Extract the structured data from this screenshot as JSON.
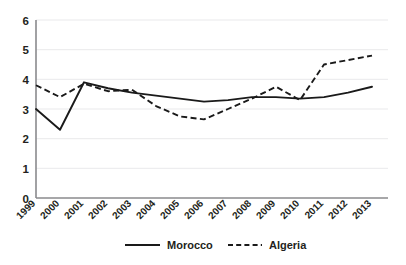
{
  "chart_data": {
    "type": "line",
    "title": "",
    "subtitle": "",
    "xlabel": "",
    "ylabel": "",
    "x": [
      "1999",
      "2000",
      "2001",
      "2002",
      "2003",
      "2004",
      "2005",
      "2006",
      "2007",
      "2008",
      "2009",
      "2010",
      "2011",
      "2012",
      "2013"
    ],
    "categories": [
      "1999",
      "2000",
      "2001",
      "2002",
      "2003",
      "2004",
      "2005",
      "2006",
      "2007",
      "2008",
      "2009",
      "2010",
      "2011",
      "2012",
      "2013"
    ],
    "series": [
      {
        "name": "Morocco",
        "style": "solid",
        "color": "#1a1a1a",
        "values": [
          3.0,
          2.3,
          3.9,
          3.7,
          3.55,
          3.45,
          3.35,
          3.25,
          3.3,
          3.4,
          3.4,
          3.35,
          3.4,
          3.55,
          3.75
        ]
      },
      {
        "name": "Algeria",
        "style": "dashed",
        "color": "#1a1a1a",
        "values": [
          3.8,
          3.4,
          3.85,
          3.6,
          3.65,
          3.1,
          2.75,
          2.65,
          3.0,
          3.35,
          3.75,
          3.3,
          4.5,
          4.65,
          4.8
        ]
      }
    ],
    "ylim": [
      0,
      6
    ],
    "yticks": [
      "0",
      "1",
      "2",
      "3",
      "4",
      "5",
      "6"
    ],
    "ytick_values": [
      0,
      1,
      2,
      3,
      4,
      5,
      6
    ],
    "grid": true,
    "grid_axis": "y",
    "legend_position": "bottom-center",
    "xtick_rotation": -45
  },
  "legend": {
    "items": [
      {
        "label": "Morocco",
        "style": "solid"
      },
      {
        "label": "Algeria",
        "style": "dashed"
      }
    ]
  }
}
